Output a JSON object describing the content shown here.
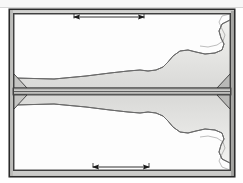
{
  "canvas": {
    "width": 243,
    "height": 183,
    "background": "#ffffff"
  },
  "drawing": {
    "title": "mirrored-profile-section-drawing",
    "description": "Technical line drawing: two mirrored rectangular frames sharing a horizontal parting line, each containing a tapered wedge profile and a lobed right-hand contour, with dimension arrows top and bottom.",
    "colors": {
      "outline_dark": "#2b2b2b",
      "outline_mid": "#6e6e6e",
      "fill_light": "#e8e8e6",
      "fill_lighter": "#f0f0ee",
      "fill_white": "#fdfdfd",
      "frame_gray": "#d9d9d7",
      "shadow_gray": "#a8a8a6",
      "page_white": "#ffffff",
      "top_strip": "#f7f7f7",
      "arrow_black": "#1a1a1a"
    },
    "geometry": {
      "outer_frame": {
        "x": 9,
        "y": 9,
        "width": 226,
        "height": 168
      },
      "parting_line_y": 92,
      "upper_panel": {
        "x": 14,
        "y": 14,
        "width": 216,
        "height": 74
      },
      "lower_panel": {
        "x": 14,
        "y": 96,
        "width": 216,
        "height": 74
      }
    }
  },
  "dimensions": [
    {
      "id": "top-dimension",
      "name": "dimension-line-top",
      "x1": 73,
      "x2": 145,
      "y": 17,
      "arrow_left": "filled-arrowhead",
      "arrow_right": "filled-arrowhead",
      "label": ""
    },
    {
      "id": "bottom-dimension",
      "name": "dimension-line-bottom",
      "x1": 92,
      "x2": 150,
      "y": 167,
      "arrow_left": "filled-arrowhead",
      "arrow_right": "filled-arrowhead",
      "label": ""
    }
  ],
  "parts": [
    {
      "id": "upper-cavity",
      "name": "upper-cavity-profile",
      "half": "upper",
      "notes": "tapered wedge widening left-to-right, terminating in rounded lobe and stepped right contour"
    },
    {
      "id": "lower-cavity",
      "name": "lower-cavity-profile",
      "half": "lower",
      "notes": "mirror of upper cavity about the parting line"
    },
    {
      "id": "upper-left-gusset",
      "name": "corner-gusset-upper-left",
      "half": "upper"
    },
    {
      "id": "lower-left-gusset",
      "name": "corner-gusset-lower-left",
      "half": "lower"
    },
    {
      "id": "upper-right-gusset",
      "name": "corner-gusset-upper-right",
      "half": "upper"
    },
    {
      "id": "lower-right-gusset",
      "name": "corner-gusset-lower-right",
      "half": "lower"
    }
  ]
}
